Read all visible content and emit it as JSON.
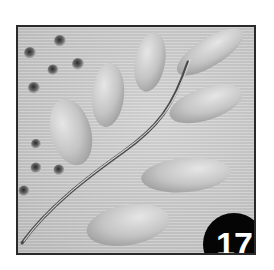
{
  "image": {
    "subject": "embossed clay tile with leafy branch and dot impressions",
    "badge": {
      "number": "17",
      "background": "#050505",
      "text_color": "#ffffff"
    },
    "colors": {
      "tile": "#c9c9c9",
      "frame": "#2a2a2a",
      "background": "#ffffff"
    }
  }
}
